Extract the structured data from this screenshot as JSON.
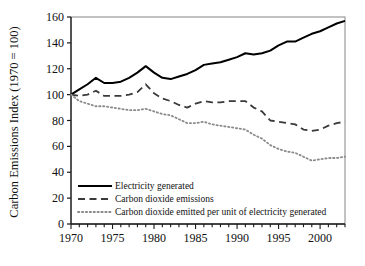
{
  "chart_data": {
    "type": "line",
    "title": "",
    "xlabel": "",
    "ylabel": "Carbon Emissions Index (1970 = 100)",
    "xlim": [
      1970,
      2003
    ],
    "ylim": [
      0,
      160
    ],
    "ytick_labels": [
      "0",
      "20",
      "40",
      "60",
      "80",
      "100",
      "120",
      "140",
      "160"
    ],
    "yticks": [
      0,
      20,
      40,
      60,
      80,
      100,
      120,
      140,
      160
    ],
    "xtick_labels": [
      "1970",
      "1975",
      "1980",
      "1985",
      "1990",
      "1995",
      "2000"
    ],
    "xticks": [
      1970,
      1975,
      1980,
      1985,
      1990,
      1995,
      2000
    ],
    "x_minor_tick_step": 1,
    "grid": false,
    "legend_position": "lower-left-inside",
    "x": [
      1970,
      1971,
      1972,
      1973,
      1974,
      1975,
      1976,
      1977,
      1978,
      1979,
      1980,
      1981,
      1982,
      1983,
      1984,
      1985,
      1986,
      1987,
      1988,
      1989,
      1990,
      1991,
      1992,
      1993,
      1994,
      1995,
      1996,
      1997,
      1998,
      1999,
      2000,
      2001,
      2002,
      2003
    ],
    "series": [
      {
        "name": "Electricity generated",
        "style": "solid",
        "color": "#000000",
        "values": [
          100,
          104,
          108,
          113,
          109,
          109,
          110,
          113,
          117,
          122,
          117,
          113,
          112,
          114,
          116,
          119,
          123,
          124,
          125,
          127,
          129,
          132,
          131,
          132,
          134,
          138,
          141,
          141,
          144,
          147,
          149,
          152,
          155,
          157
        ]
      },
      {
        "name": "Carbon dioxide emissions",
        "style": "dashed",
        "color": "#3a3a3a",
        "values": [
          100,
          99,
          100,
          103,
          99,
          99,
          99,
          100,
          102,
          108,
          101,
          97,
          95,
          92,
          90,
          93,
          95,
          94,
          94,
          95,
          95,
          95,
          90,
          87,
          80,
          79,
          78,
          77,
          73,
          72,
          73,
          76,
          78,
          79
        ]
      },
      {
        "name": "Carbon dioxide emitted per unit of electricity generated",
        "style": "dotted",
        "color": "#8a8a8a",
        "values": [
          100,
          95,
          93,
          91,
          91,
          90,
          89,
          88,
          88,
          89,
          87,
          85,
          84,
          81,
          78,
          78,
          79,
          77,
          76,
          75,
          74,
          73,
          69,
          66,
          61,
          58,
          56,
          55,
          52,
          49,
          50,
          51,
          51,
          52
        ]
      }
    ]
  },
  "legend": {
    "items": [
      {
        "label": "Electricity generated"
      },
      {
        "label": "Carbon dioxide emissions"
      },
      {
        "label": "Carbon dioxide emitted per unit of electricity generated"
      }
    ]
  }
}
